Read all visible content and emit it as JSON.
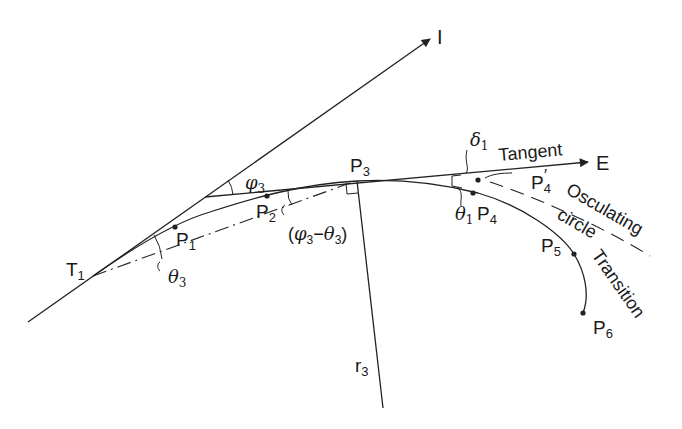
{
  "diagram": {
    "labels": {
      "I": "I",
      "E": "E",
      "T1": "T",
      "T1_sub": "1",
      "P1": "P",
      "P1_sub": "1",
      "P2": "P",
      "P2_sub": "2",
      "P3": "P",
      "P3_sub": "3",
      "P4": "P",
      "P4_sub": "4",
      "P4prime": "P",
      "P4prime_sub": "4",
      "P4prime_mark": "′",
      "P5": "P",
      "P5_sub": "5",
      "P6": "P",
      "P6_sub": "6",
      "r3": "r",
      "r3_sub": "3",
      "phi3": "φ",
      "phi3_sub": "3",
      "theta3": "θ",
      "theta3_sub": "3",
      "theta1": "θ",
      "theta1_sub": "1",
      "delta1": "δ",
      "delta1_sub": "1",
      "phi_minus_theta_open": "(",
      "phi_minus_theta_phi": "φ",
      "phi_minus_theta_phi_sub": "3",
      "phi_minus_theta_minus": "−",
      "phi_minus_theta_theta": "θ",
      "phi_minus_theta_theta_sub": "3",
      "phi_minus_theta_close": ")",
      "tangent": "Tangent",
      "osculating": "Osculating",
      "circle": "circle",
      "transition": "Transition"
    },
    "colors": {
      "stroke": "#222222",
      "text": "#1a1a1a",
      "background": "#ffffff"
    }
  }
}
